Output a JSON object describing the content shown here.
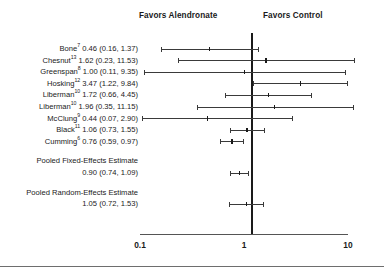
{
  "header": {
    "left_label": "Favors Alendronate",
    "right_label": "Favors Control"
  },
  "axis": {
    "ticks": [
      "0.1",
      "1",
      "10"
    ],
    "scale": "log",
    "min": 0.1,
    "max": 10
  },
  "chart_data": {
    "type": "forest",
    "title": "",
    "xlabel": "",
    "ylabel": "",
    "scale": "log",
    "xlim": [
      0.1,
      10
    ],
    "xticks": [
      0.1,
      1,
      10
    ],
    "null_value": 1,
    "left_annotation": "Favors Alendronate",
    "right_annotation": "Favors Control",
    "grid": false,
    "rows": [
      {
        "study": "Bone",
        "ref": "7",
        "estimate": 0.46,
        "ci_low": 0.16,
        "ci_high": 1.37,
        "label": "Bone7 0.46 (0.16, 1.37)",
        "pooled": false
      },
      {
        "study": "Chesnut",
        "ref": "13",
        "estimate": 1.62,
        "ci_low": 0.23,
        "ci_high": 11.53,
        "label": "Chesnut13 1.62 (0.23, 11.53)",
        "pooled": false
      },
      {
        "study": "Greenspan",
        "ref": "8",
        "estimate": 1.0,
        "ci_low": 0.11,
        "ci_high": 9.35,
        "label": "Greenspan8 1.00 (0.11, 9.35)",
        "pooled": false
      },
      {
        "study": "Hosking",
        "ref": "12",
        "estimate": 3.47,
        "ci_low": 1.22,
        "ci_high": 9.84,
        "label": "Hosking12 3.47 (1.22, 9.84)",
        "pooled": false
      },
      {
        "study": "Liberman",
        "ref": "10",
        "estimate": 1.72,
        "ci_low": 0.66,
        "ci_high": 4.45,
        "label": "Liberman10 1.72 (0.66, 4.45)",
        "pooled": false
      },
      {
        "study": "Liberman",
        "ref": "10",
        "estimate": 1.96,
        "ci_low": 0.35,
        "ci_high": 11.15,
        "label": "Liberman10 1.96 (0.35, 11.15)",
        "pooled": false
      },
      {
        "study": "McClung",
        "ref": "9",
        "estimate": 0.44,
        "ci_low": 0.07,
        "ci_high": 2.9,
        "label": "McClung9 0.44 (0.07, 2.90)",
        "pooled": false
      },
      {
        "study": "Black",
        "ref": "11",
        "estimate": 1.06,
        "ci_low": 0.73,
        "ci_high": 1.55,
        "label": "Black11 1.06 (0.73, 1.55)",
        "pooled": false
      },
      {
        "study": "Cumming",
        "ref": "6",
        "estimate": 0.76,
        "ci_low": 0.59,
        "ci_high": 0.97,
        "label": "Cumming6 0.76 (0.59, 0.97)",
        "pooled": false
      }
    ],
    "pooled": [
      {
        "name": "Pooled Fixed-Effects Estimate",
        "estimate": 0.9,
        "ci_low": 0.74,
        "ci_high": 1.09,
        "value_label": "0.90 (0.74, 1.09)"
      },
      {
        "name": "Pooled Random-Effects Estimate",
        "estimate": 1.05,
        "ci_low": 0.72,
        "ci_high": 1.53,
        "value_label": "1.05 (0.72, 1.53)"
      }
    ]
  },
  "studies": [
    {
      "name": "Bone",
      "sup": "7",
      "stats": " 0.46 (0.16, 1.37)"
    },
    {
      "name": "Chesnut",
      "sup": "13",
      "stats": " 1.62 (0.23, 11.53)"
    },
    {
      "name": "Greenspan",
      "sup": "8",
      "stats": " 1.00 (0.11, 9.35)"
    },
    {
      "name": "Hosking",
      "sup": "12",
      "stats": " 3.47 (1.22, 9.84)"
    },
    {
      "name": "Liberman",
      "sup": "10",
      "stats": " 1.72 (0.66, 4.45)"
    },
    {
      "name": "Liberman",
      "sup": "10",
      "stats": " 1.96 (0.35, 11.15)"
    },
    {
      "name": "McClung",
      "sup": "9",
      "stats": " 0.44 (0.07, 2.90)"
    },
    {
      "name": "Black",
      "sup": "11",
      "stats": " 1.06 (0.73, 1.55)"
    },
    {
      "name": "Cumming",
      "sup": "6",
      "stats": " 0.76 (0.59, 0.97)"
    }
  ],
  "pooled_labels": {
    "fixed_title": "Pooled Fixed-Effects Estimate",
    "fixed_value": "0.90 (0.74, 1.09)",
    "random_title": "Pooled Random-Effects Estimate",
    "random_value": "1.05 (0.72, 1.53)"
  }
}
